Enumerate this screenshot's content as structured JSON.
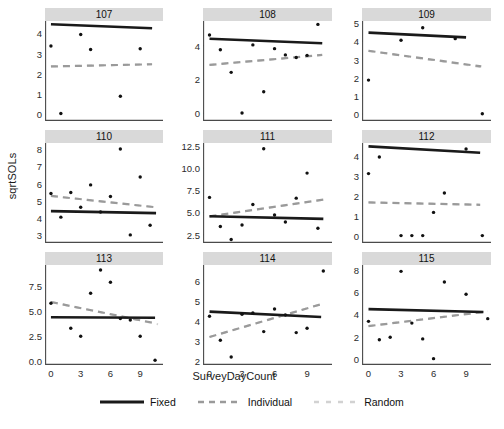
{
  "chart_data": {
    "type": "scatter",
    "title": "",
    "xlabel": "SurveyDayCount",
    "ylabel": "sqrtSOLs",
    "grid": false,
    "legend_position": "bottom",
    "xlim": [
      -0.6,
      11.3
    ],
    "xticks": [
      0,
      3,
      6,
      9
    ],
    "facet_variable": "Subject",
    "series_styles": [
      {
        "name": "Fixed",
        "style": "solid",
        "color": "#1a1a1a",
        "width": 2.6
      },
      {
        "name": "Individual",
        "style": "dashed",
        "color": "#9a9a9a",
        "width": 2.2
      },
      {
        "name": "Random",
        "style": "dotted",
        "color": "#d2d2d2",
        "width": 2.0
      }
    ],
    "panels": [
      {
        "label": "107",
        "ylim": [
          -0.35,
          4.62
        ],
        "yticks": [
          "0",
          "1",
          "2",
          "3",
          "4"
        ],
        "ytickvals": [
          0,
          1,
          2,
          3,
          4
        ],
        "points": [
          [
            0,
            3.38
          ],
          [
            1,
            0.02
          ],
          [
            3,
            3.95
          ],
          [
            4,
            3.2
          ],
          [
            7,
            0.88
          ],
          [
            9,
            3.24
          ]
        ],
        "lines": {
          "Fixed": [
            [
              0,
              4.46
            ],
            [
              10.2,
              4.26
            ]
          ],
          "Individual": [
            [
              0,
              2.36
            ],
            [
              10.2,
              2.47
            ]
          ],
          "Random": [
            [
              0,
              2.36
            ],
            [
              10.2,
              2.47
            ]
          ]
        }
      },
      {
        "label": "108",
        "ylim": [
          -0.45,
          5.45
        ],
        "yticks": [
          "0",
          "2",
          "4"
        ],
        "ytickvals": [
          0,
          2,
          4
        ],
        "points": [
          [
            0,
            4.62
          ],
          [
            1,
            3.75
          ],
          [
            2,
            2.42
          ],
          [
            3,
            0.02
          ],
          [
            4,
            4.04
          ],
          [
            5,
            1.28
          ],
          [
            6,
            3.82
          ],
          [
            7,
            3.45
          ],
          [
            8,
            3.3
          ],
          [
            9,
            3.42
          ],
          [
            10,
            5.25
          ]
        ],
        "lines": {
          "Fixed": [
            [
              0,
              4.4
            ],
            [
              10.4,
              4.14
            ]
          ],
          "Individual": [
            [
              0,
              2.86
            ],
            [
              10.4,
              3.45
            ]
          ],
          "Random": [
            [
              0,
              2.86
            ],
            [
              10.4,
              3.45
            ]
          ]
        }
      },
      {
        "label": "109",
        "ylim": [
          -0.38,
          5.12
        ],
        "yticks": [
          "0",
          "1",
          "2",
          "3",
          "4",
          "5"
        ],
        "ytickvals": [
          0,
          1,
          2,
          3,
          4,
          5
        ],
        "points": [
          [
            0,
            1.87
          ],
          [
            3,
            4.06
          ],
          [
            5,
            4.75
          ],
          [
            8,
            4.15
          ],
          [
            10.5,
            0.02
          ]
        ],
        "lines": {
          "Fixed": [
            [
              0,
              4.48
            ],
            [
              9.0,
              4.22
            ]
          ],
          "Individual": [
            [
              0,
              3.48
            ],
            [
              10.4,
              2.62
            ]
          ],
          "Random": [
            [
              0,
              3.48
            ],
            [
              10.8,
              2.55
            ]
          ]
        }
      },
      {
        "label": "110",
        "ylim": [
          2.55,
          8.35
        ],
        "yticks": [
          "3",
          "4",
          "5",
          "6",
          "7",
          "8"
        ],
        "ytickvals": [
          3,
          4,
          5,
          6,
          7,
          8
        ],
        "points": [
          [
            0,
            5.42
          ],
          [
            1,
            4.05
          ],
          [
            2,
            5.48
          ],
          [
            3,
            4.62
          ],
          [
            4,
            5.92
          ],
          [
            5,
            4.35
          ],
          [
            6,
            5.25
          ],
          [
            7,
            8.0
          ],
          [
            8,
            3.02
          ],
          [
            9,
            6.38
          ],
          [
            10,
            3.58
          ]
        ],
        "lines": {
          "Fixed": [
            [
              0,
              4.4
            ],
            [
              10.6,
              4.28
            ]
          ],
          "Individual": [
            [
              0,
              5.28
            ],
            [
              10.6,
              4.62
            ]
          ],
          "Random": [
            [
              0,
              5.28
            ],
            [
              10.6,
              4.62
            ]
          ]
        }
      },
      {
        "label": "111",
        "ylim": [
          1.55,
          12.85
        ],
        "yticks": [
          "2.5",
          "5.0",
          "7.5",
          "10.0",
          "12.5"
        ],
        "ytickvals": [
          2.5,
          5.0,
          7.5,
          10.0,
          12.5
        ],
        "points": [
          [
            0,
            6.7
          ],
          [
            1,
            3.42
          ],
          [
            2,
            1.95
          ],
          [
            3,
            3.58
          ],
          [
            4,
            5.9
          ],
          [
            5,
            12.2
          ],
          [
            6,
            4.72
          ],
          [
            7,
            3.92
          ],
          [
            8,
            6.62
          ],
          [
            9,
            9.45
          ],
          [
            10,
            3.22
          ]
        ],
        "lines": {
          "Fixed": [
            [
              0,
              4.58
            ],
            [
              10.5,
              4.28
            ]
          ],
          "Individual": [
            [
              0,
              4.55
            ],
            [
              10.5,
              6.45
            ]
          ],
          "Random": [
            [
              0,
              4.55
            ],
            [
              10.5,
              6.45
            ]
          ]
        }
      },
      {
        "label": "112",
        "ylim": [
          -0.35,
          4.65
        ],
        "yticks": [
          "0",
          "1",
          "2",
          "3",
          "4"
        ],
        "ytickvals": [
          0,
          1,
          2,
          3,
          4
        ],
        "points": [
          [
            0,
            3.12
          ],
          [
            1,
            3.95
          ],
          [
            3,
            0.02
          ],
          [
            4,
            0.02
          ],
          [
            5,
            0.02
          ],
          [
            6,
            1.18
          ],
          [
            7,
            2.15
          ],
          [
            9,
            4.35
          ],
          [
            10.5,
            0.02
          ]
        ],
        "lines": {
          "Fixed": [
            [
              0,
              4.48
            ],
            [
              10.3,
              4.16
            ]
          ],
          "Individual": [
            [
              0,
              1.68
            ],
            [
              10.3,
              1.56
            ]
          ],
          "Random": [
            [
              0,
              1.68
            ],
            [
              10.3,
              1.56
            ]
          ]
        }
      },
      {
        "label": "113",
        "ylim": [
          -0.45,
          9.55
        ],
        "yticks": [
          "0.0",
          "2.5",
          "5.0",
          "7.5"
        ],
        "ytickvals": [
          0.0,
          2.5,
          5.0,
          7.5
        ],
        "points": [
          [
            0,
            5.72
          ],
          [
            2,
            3.22
          ],
          [
            3,
            2.42
          ],
          [
            4,
            6.72
          ],
          [
            5,
            9.05
          ],
          [
            6,
            7.82
          ],
          [
            7,
            4.2
          ],
          [
            8,
            4.05
          ],
          [
            9,
            2.42
          ],
          [
            10.5,
            0.02
          ]
        ],
        "lines": {
          "Fixed": [
            [
              0,
              4.32
            ],
            [
              10.5,
              4.28
            ]
          ],
          "Individual": [
            [
              0,
              5.85
            ],
            [
              10.5,
              3.72
            ]
          ],
          "Random": [
            [
              0,
              5.85
            ],
            [
              10.8,
              3.62
            ]
          ]
        }
      },
      {
        "label": "114",
        "ylim": [
          1.78,
          6.78
        ],
        "yticks": [
          "2",
          "3",
          "4",
          "5",
          "6"
        ],
        "ytickvals": [
          2,
          3,
          4,
          5,
          6
        ],
        "points": [
          [
            0,
            4.22
          ],
          [
            1,
            3.02
          ],
          [
            2,
            2.18
          ],
          [
            3,
            4.32
          ],
          [
            4,
            4.38
          ],
          [
            5,
            3.45
          ],
          [
            6,
            4.58
          ],
          [
            7,
            4.28
          ],
          [
            8,
            3.4
          ],
          [
            9,
            3.62
          ],
          [
            10.5,
            6.48
          ]
        ],
        "lines": {
          "Fixed": [
            [
              0,
              4.45
            ],
            [
              10.3,
              4.18
            ]
          ],
          "Individual": [
            [
              0,
              3.18
            ],
            [
              10.3,
              4.82
            ]
          ],
          "Random": [
            [
              0,
              3.18
            ],
            [
              10.3,
              4.82
            ]
          ]
        }
      },
      {
        "label": "115",
        "ylim": [
          -0.55,
          8.45
        ],
        "yticks": [
          "0",
          "2",
          "4",
          "6",
          "8"
        ],
        "ytickvals": [
          0,
          2,
          4,
          6,
          8
        ],
        "points": [
          [
            0,
            3.38
          ],
          [
            1,
            1.72
          ],
          [
            2,
            1.95
          ],
          [
            3,
            7.88
          ],
          [
            4,
            3.22
          ],
          [
            5,
            1.8
          ],
          [
            6,
            0.02
          ],
          [
            7,
            6.92
          ],
          [
            9,
            5.82
          ],
          [
            11,
            3.62
          ]
        ],
        "lines": {
          "Fixed": [
            [
              0,
              4.48
            ],
            [
              10.6,
              4.22
            ]
          ],
          "Individual": [
            [
              0,
              2.95
            ],
            [
              10.6,
              4.22
            ]
          ],
          "Random": [
            [
              0,
              2.95
            ],
            [
              11.0,
              4.3
            ]
          ]
        }
      }
    ],
    "legend": [
      {
        "label": "Fixed",
        "style": "solid"
      },
      {
        "label": "Individual",
        "style": "dashed"
      },
      {
        "label": "Random",
        "style": "dotted"
      }
    ]
  }
}
